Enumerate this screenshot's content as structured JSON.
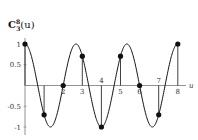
{
  "chart_data": {
    "type": "line",
    "title_main": "C",
    "title_sup": "8",
    "title_sub": "3",
    "title_arg": "(u)",
    "xlabel": "u",
    "ylabel": "",
    "xlim": [
      0,
      8
    ],
    "ylim": [
      -1,
      1
    ],
    "x_ticks": [
      "2",
      "3",
      "4",
      "5",
      "6",
      "7",
      "8"
    ],
    "y_ticks": [
      "1",
      "0.5",
      "-0.5",
      "-1"
    ],
    "grid": false,
    "curve": "cos(3*pi*u/4)",
    "series": [
      {
        "name": "samples",
        "x": [
          0,
          1,
          2,
          3,
          4,
          5,
          6,
          7,
          8
        ],
        "values": [
          1,
          -0.707,
          0,
          0.707,
          -1,
          0.707,
          0,
          -0.707,
          1
        ]
      }
    ]
  }
}
